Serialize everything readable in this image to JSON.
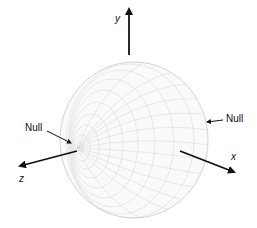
{
  "diagram": {
    "type": "3d-radiation-pattern",
    "axes": {
      "y": {
        "label": "y"
      },
      "z": {
        "label": "z"
      },
      "x": {
        "label": "x"
      }
    },
    "annotations": {
      "null_left": "Null",
      "null_right": "Null"
    },
    "colors": {
      "background": "#ffffff",
      "mesh": "#bdbdbd",
      "arrows": "#111111"
    }
  }
}
